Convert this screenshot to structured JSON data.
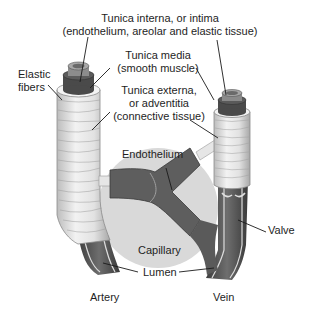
{
  "diagram": {
    "labels": {
      "tunica_interna_1": "Tunica interna, or intima",
      "tunica_interna_2": "(endothelium, areolar and elastic tissue)",
      "tunica_media_1": "Tunica media",
      "tunica_media_2": "(smooth muscle)",
      "elastic_fibers_1": "Elastic",
      "elastic_fibers_2": "fibers",
      "tunica_externa_1": "Tunica externa,",
      "tunica_externa_2": "or adventitia",
      "tunica_externa_3": "(connective tissue)",
      "endothelium": "Endothelium",
      "valve": "Valve",
      "capillary": "Capillary",
      "lumen": "Lumen",
      "artery": "Artery",
      "vein": "Vein"
    },
    "colors": {
      "background": "#ffffff",
      "capillary_bed": "#d9d9d9",
      "vessel_dark": "#5a5a5a",
      "vessel_mid": "#7a7a7a",
      "externa_light": "#eeeeee",
      "leader_line": "#1a1a1a"
    }
  }
}
